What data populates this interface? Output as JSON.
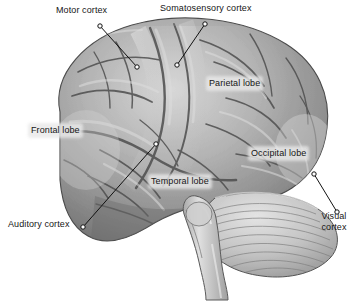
{
  "figure": {
    "type": "anatomical-diagram",
    "view": "left lateral",
    "background_color": "#ffffff",
    "text_color": "#161616",
    "halo_color": "#e8e8e8",
    "leader_color": "#111111"
  },
  "labels": {
    "motor_cortex": "Motor cortex",
    "somatosensory_cortex": "Somatosensory cortex",
    "parietal_lobe": "Parietal lobe",
    "frontal_lobe": "Frontal lobe",
    "occipital_lobe": "Occipital lobe",
    "temporal_lobe": "Temporal lobe",
    "auditory_cortex": "Auditory cortex",
    "visual_cortex_line1": "Visual",
    "visual_cortex_line2": "cortex"
  },
  "structures": {
    "cerebrum": "cerebrum",
    "cerebellum": "cerebellum",
    "brainstem": "brainstem"
  }
}
